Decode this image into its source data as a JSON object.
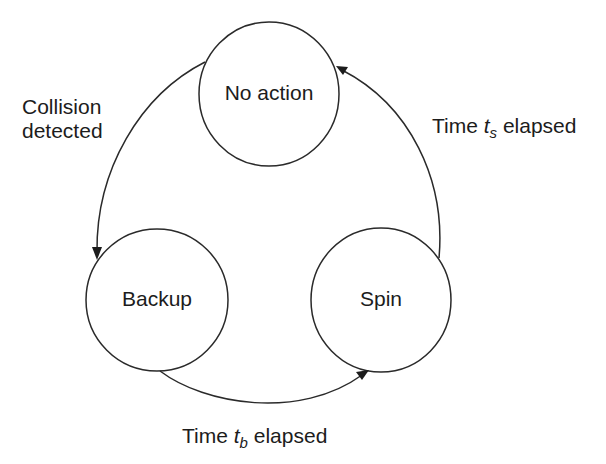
{
  "diagram": {
    "type": "state-machine",
    "states": [
      {
        "id": "no_action",
        "label": "No action"
      },
      {
        "id": "backup",
        "label": "Backup"
      },
      {
        "id": "spin",
        "label": "Spin"
      }
    ],
    "transitions": [
      {
        "from": "no_action",
        "to": "backup",
        "label_line1": "Collision",
        "label_line2": "detected"
      },
      {
        "from": "backup",
        "to": "spin",
        "label_prefix": "Time ",
        "label_var": "t",
        "label_sub": "b",
        "label_suffix": " elapsed"
      },
      {
        "from": "spin",
        "to": "no_action",
        "label_prefix": "Time ",
        "label_var": "t",
        "label_sub": "s",
        "label_suffix": " elapsed"
      }
    ],
    "colors": {
      "stroke": "#2a2a2a",
      "text": "#1c1c1c",
      "background": "#ffffff"
    }
  }
}
